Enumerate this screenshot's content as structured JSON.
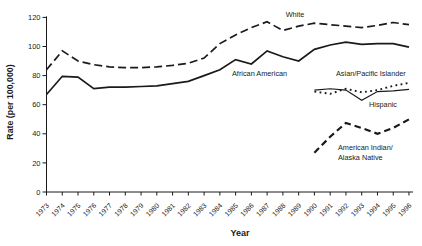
{
  "chart_data": {
    "type": "line",
    "title": "",
    "xlabel": "Year",
    "ylabel": "Rate (per 100,000)",
    "ylim": [
      0,
      120
    ],
    "yticks": [
      0,
      20,
      40,
      60,
      80,
      100,
      120
    ],
    "x_years": [
      1973,
      1974,
      1975,
      1976,
      1977,
      1978,
      1979,
      1980,
      1981,
      1982,
      1983,
      1984,
      1985,
      1986,
      1987,
      1988,
      1989,
      1990,
      1991,
      1992,
      1993,
      1994,
      1995,
      1996
    ],
    "grid": false,
    "legend_position": "inline-annotations",
    "line_color": "#1a1a1a",
    "series": [
      {
        "name": "White",
        "style": "long-dash",
        "start_year": 1973,
        "values": [
          84,
          97,
          90,
          87.5,
          86,
          85.5,
          85.5,
          86,
          87,
          88.5,
          92,
          102,
          108,
          113,
          117,
          111,
          114,
          116,
          115,
          114,
          113,
          114.5,
          116.5,
          115
        ],
        "label": {
          "lines": [
            "White"
          ],
          "px": 295,
          "py": 17,
          "anchor": "middle"
        }
      },
      {
        "name": "African American",
        "style": "solid",
        "start_year": 1973,
        "values": [
          67,
          79.5,
          79,
          71,
          72,
          72,
          72.5,
          73,
          74.5,
          76,
          80,
          84,
          91,
          88,
          97,
          93,
          90,
          98,
          101,
          103,
          101.5,
          102,
          102,
          99.5
        ],
        "label": {
          "lines": [
            "African American"
          ],
          "px": 232,
          "py": 76,
          "anchor": "start"
        }
      },
      {
        "name": "Asian/Pacific Islander",
        "style": "dotted",
        "start_year": 1990,
        "values": [
          69,
          67.5,
          71,
          68.5,
          70,
          73,
          75
        ],
        "label": {
          "lines": [
            "Asian/Pacific Islander"
          ],
          "px": 336,
          "py": 76,
          "anchor": "start"
        }
      },
      {
        "name": "Hispanic",
        "style": "thin-solid",
        "start_year": 1990,
        "values": [
          70,
          71,
          70,
          63,
          69,
          69.5,
          70.5
        ],
        "label": {
          "lines": [
            "Hispanic"
          ],
          "px": 369,
          "py": 106.5,
          "anchor": "start"
        }
      },
      {
        "name": "American Indian/Alaska Native",
        "style": "bold-dash",
        "start_year": 1990,
        "values": [
          27,
          38,
          47.5,
          44,
          40,
          44,
          50
        ],
        "label": {
          "lines": [
            "American Indian/",
            "Alaska Native"
          ],
          "px": 338,
          "py": 149.5,
          "anchor": "start"
        }
      }
    ]
  },
  "colors": {
    "ink": "#1a1a1a",
    "background": "#ffffff"
  }
}
